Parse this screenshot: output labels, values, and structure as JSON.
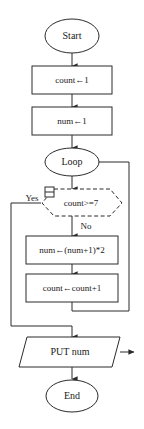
{
  "diagram": {
    "type": "flowchart",
    "title": "",
    "nodes": {
      "start": {
        "label": "Start",
        "shape": "terminal-oval"
      },
      "init_count": {
        "label": "count←1",
        "shape": "process-rectangle"
      },
      "init_num": {
        "label": "num←1",
        "shape": "process-rectangle"
      },
      "loop": {
        "label": "Loop",
        "shape": "loop-oval"
      },
      "decision": {
        "label": "count>=7",
        "shape": "decision-hexagon-dashed"
      },
      "update_num": {
        "label": "num←(num+1)*2",
        "shape": "process-rectangle"
      },
      "update_count": {
        "label": "count←count+1",
        "shape": "process-rectangle"
      },
      "output": {
        "label": "PUT num",
        "shape": "io-parallelogram"
      },
      "end": {
        "label": "End",
        "shape": "terminal-oval"
      }
    },
    "branch_labels": {
      "yes": "Yes",
      "no": "No"
    },
    "colors": {
      "stroke": "#2b2b2b",
      "fill": "#ffffff",
      "text": "#1a1a1a"
    }
  }
}
